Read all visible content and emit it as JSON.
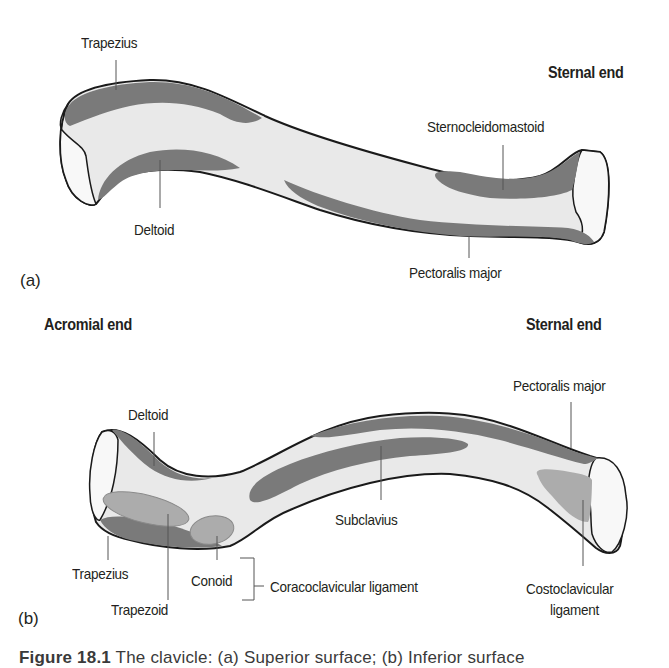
{
  "colors": {
    "muscle_dark": "#7a7a7a",
    "ligament_mid": "#acacac",
    "bone_fill": "#e9e9e9",
    "articular_fill": "#f8f8f8",
    "outline": "#1a1a1a",
    "leader": "#555555"
  },
  "figure_a": {
    "panel_label": "(a)",
    "end_label_right": "Sternal end",
    "labels": {
      "trapezius": "Trapezius",
      "deltoid": "Deltoid",
      "sternocleidomastoid": "Sternocleidomastoid",
      "pectoralis_major": "Pectoralis major"
    }
  },
  "figure_b": {
    "panel_label": "(b)",
    "end_label_left": "Acromial end",
    "end_label_right": "Sternal end",
    "labels": {
      "deltoid": "Deltoid",
      "pectoralis_major": "Pectoralis major",
      "subclavius": "Subclavius",
      "trapezius": "Trapezius",
      "conoid": "Conoid",
      "trapezoid": "Trapezoid",
      "coracoclavicular_ligament": "Coracoclavicular ligament",
      "costoclavicular_line1": "Costoclavicular",
      "costoclavicular_line2": "ligament"
    }
  },
  "caption": {
    "figure_number": "Figure 18.1",
    "text": " The clavicle: (a) Superior surface; (b) Inferior surface"
  }
}
